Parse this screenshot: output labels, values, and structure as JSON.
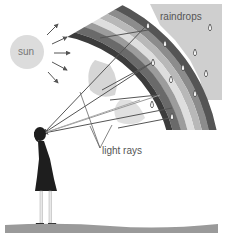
{
  "diagram": {
    "labels": {
      "sun": "sun",
      "raindrops": "raindrops",
      "light_rays": "light rays"
    },
    "elements": {
      "sun": {
        "shape": "circle",
        "color": "#dcdcdc",
        "ray_count": 5
      },
      "rainbow": {
        "shape": "arc-band",
        "band_colors": [
          "#5a5a5a",
          "#8a8a8a",
          "#b5b5b5",
          "#d8d8d8",
          "#9a9a9a",
          "#6e6e6e"
        ]
      },
      "sky_background": {
        "color": "#c9c9c9"
      },
      "raindrops": {
        "count": 11,
        "color": "#ffffff",
        "outline": "#444444"
      },
      "observer": {
        "type": "girl",
        "color": "#1e1e1e"
      },
      "ground": {
        "color": "#9a9a9a"
      }
    },
    "colors": {
      "ray": "#555555",
      "text": "#555555",
      "background": "#ffffff"
    }
  }
}
